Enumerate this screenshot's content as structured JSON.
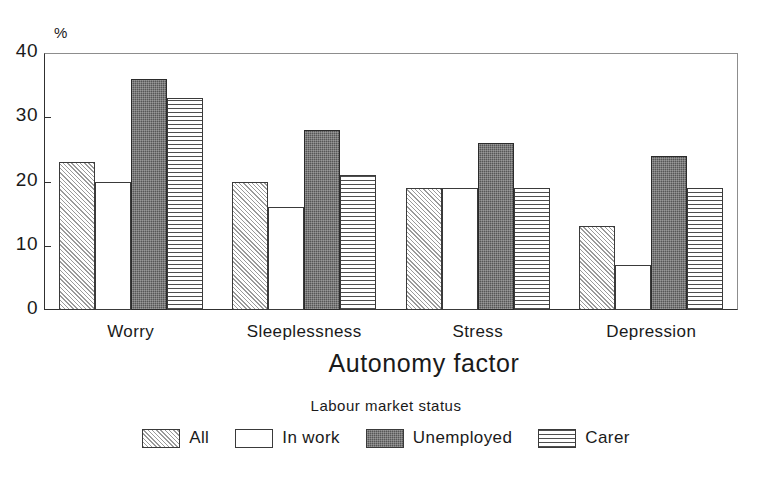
{
  "chart_data": {
    "type": "bar",
    "title": "",
    "subtitle": "",
    "xlabel": "Autonomy factor",
    "ylabel": "%",
    "grid": false,
    "legend_position": "bottom",
    "legend_title": "Labour market status",
    "categories": [
      "Worry",
      "Sleeplessness",
      "Stress",
      "Depression"
    ],
    "series": [
      {
        "name": "All",
        "pattern": "diagonal-hatch",
        "values": [
          23,
          20,
          19,
          13
        ]
      },
      {
        "name": "In work",
        "pattern": "white-empty",
        "values": [
          20,
          16,
          19,
          7
        ]
      },
      {
        "name": "Unemployed",
        "pattern": "dark-dense-stipple",
        "values": [
          36,
          28,
          26,
          24
        ]
      },
      {
        "name": "Carer",
        "pattern": "horizontal-lines",
        "values": [
          33,
          21,
          19,
          19
        ]
      }
    ],
    "ylim": [
      0,
      40
    ],
    "ytick_labels": [
      "0",
      "10",
      "20",
      "30",
      "40"
    ],
    "ytick_values": [
      0,
      10,
      20,
      30,
      40
    ],
    "colors": {
      "all": "#e9e9e9",
      "in_work": "#ffffff",
      "unemployed": "#565656",
      "carer": "#ffffff",
      "axis": "#303030",
      "frame": "#8d8d8d",
      "text": "#1a1a1a",
      "background": "#ffffff"
    }
  },
  "axes": {
    "y_unit_label": "%",
    "x_title": "Autonomy factor"
  },
  "legend": {
    "title": "Labour market status",
    "items": [
      {
        "label": "All"
      },
      {
        "label": "In work"
      },
      {
        "label": "Unemployed"
      },
      {
        "label": "Carer"
      }
    ]
  }
}
